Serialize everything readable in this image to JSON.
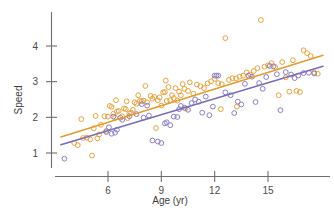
{
  "chart_data": {
    "type": "scatter",
    "title": "",
    "subtitle": "",
    "xlabel": "Age (yr)",
    "ylabel": "Speed",
    "grid": false,
    "legend": "none",
    "xlim": [
      3.3,
      18.2
    ],
    "ylim": [
      0.62,
      4.82
    ],
    "x_ticks": [
      6,
      9,
      12,
      15
    ],
    "x_tick_labels": [
      "6",
      "9",
      "12",
      "15"
    ],
    "y_ticks": [
      1,
      2,
      3,
      4
    ],
    "y_tick_labels": [
      "1",
      "2",
      "3",
      "4"
    ],
    "colors": {
      "series_orange": "#e8a33d",
      "series_purple": "#8b7fc4",
      "fit_orange": "#e59b2e",
      "fit_purple": "#7a6cb8",
      "axis": "#6e6e6e",
      "text": "#3c3c3c"
    },
    "marker": {
      "shape": "open-circle",
      "radius_px": 2.4
    },
    "series": [
      {
        "name": "series-orange",
        "color": "#e8a33d",
        "fit_line": {
          "color": "#e59b2e",
          "intercept": 0.93,
          "slope": 0.155,
          "x_start": 3.35,
          "x_end": 18.1,
          "y_start": 1.45,
          "y_end": 3.74
        },
        "points": [
          [
            4.1,
            1.28
          ],
          [
            4.3,
            1.22
          ],
          [
            4.5,
            1.95
          ],
          [
            4.6,
            1.42
          ],
          [
            4.8,
            1.43
          ],
          [
            5.0,
            1.38
          ],
          [
            5.1,
            0.93
          ],
          [
            5.2,
            1.69
          ],
          [
            5.3,
            2.04
          ],
          [
            5.4,
            1.41
          ],
          [
            5.5,
            1.52
          ],
          [
            5.6,
            1.79
          ],
          [
            5.8,
            2.03
          ],
          [
            5.9,
            1.62
          ],
          [
            6.0,
            2.02
          ],
          [
            6.1,
            2.32
          ],
          [
            6.2,
            2.29
          ],
          [
            6.3,
            2.1
          ],
          [
            6.4,
            1.99
          ],
          [
            6.5,
            2.16
          ],
          [
            6.6,
            2.18
          ],
          [
            6.8,
            2.03
          ],
          [
            6.9,
            2.25
          ],
          [
            7.0,
            2.23
          ],
          [
            7.1,
            1.98
          ],
          [
            7.2,
            2.11
          ],
          [
            7.3,
            2.13
          ],
          [
            7.4,
            2.21
          ],
          [
            7.5,
            2.42
          ],
          [
            7.6,
            2.38
          ],
          [
            7.7,
            2.62
          ],
          [
            7.8,
            2.46
          ],
          [
            7.9,
            2.45
          ],
          [
            8.0,
            2.47
          ],
          [
            8.1,
            2.88
          ],
          [
            8.2,
            2.42
          ],
          [
            8.4,
            2.6
          ],
          [
            8.5,
            2.52
          ],
          [
            8.6,
            2.57
          ],
          [
            8.7,
            1.7
          ],
          [
            8.8,
            2.48
          ],
          [
            8.9,
            2.56
          ],
          [
            9.0,
            2.33
          ],
          [
            9.1,
            2.7
          ],
          [
            9.2,
            2.71
          ],
          [
            9.3,
            2.46
          ],
          [
            9.4,
            2.85
          ],
          [
            9.5,
            2.48
          ],
          [
            9.6,
            2.62
          ],
          [
            9.7,
            2.54
          ],
          [
            9.8,
            2.82
          ],
          [
            9.9,
            2.47
          ],
          [
            10.0,
            2.72
          ],
          [
            10.1,
            2.62
          ],
          [
            10.2,
            2.93
          ],
          [
            10.3,
            2.8
          ],
          [
            10.5,
            2.74
          ],
          [
            10.6,
            2.98
          ],
          [
            10.8,
            2.66
          ],
          [
            11.0,
            2.92
          ],
          [
            11.2,
            2.87
          ],
          [
            11.4,
            2.82
          ],
          [
            11.6,
            2.95
          ],
          [
            11.8,
            3.01
          ],
          [
            12.0,
            3.08
          ],
          [
            12.2,
            2.96
          ],
          [
            12.4,
            2.93
          ],
          [
            12.6,
            4.22
          ],
          [
            12.8,
            3.05
          ],
          [
            13.0,
            3.1
          ],
          [
            13.2,
            3.09
          ],
          [
            13.4,
            3.14
          ],
          [
            13.6,
            3.17
          ],
          [
            13.8,
            3.26
          ],
          [
            14.0,
            3.2
          ],
          [
            14.2,
            3.3
          ],
          [
            14.4,
            3.38
          ],
          [
            14.6,
            4.73
          ],
          [
            14.8,
            3.42
          ],
          [
            15.0,
            3.46
          ],
          [
            15.2,
            3.52
          ],
          [
            15.4,
            3.41
          ],
          [
            15.6,
            2.62
          ],
          [
            15.8,
            3.55
          ],
          [
            16.0,
            3.12
          ],
          [
            16.2,
            2.72
          ],
          [
            16.4,
            3.6
          ],
          [
            16.6,
            2.74
          ],
          [
            16.8,
            2.71
          ],
          [
            17.0,
            3.88
          ],
          [
            17.2,
            3.8
          ],
          [
            17.4,
            3.72
          ],
          [
            17.6,
            3.26
          ],
          [
            17.8,
            3.22
          ],
          [
            6.45,
            2.48
          ],
          [
            7.05,
            2.45
          ],
          [
            9.25,
            3.03
          ],
          [
            10.35,
            2.25
          ],
          [
            12.35,
            2.23
          ],
          [
            13.25,
            2.3
          ]
        ]
      },
      {
        "name": "series-purple",
        "color": "#8b7fc4",
        "fit_line": {
          "color": "#7a6cb8",
          "intercept": 0.73,
          "slope": 0.149,
          "x_start": 3.35,
          "x_end": 18.1,
          "y_start": 1.23,
          "y_end": 3.43
        },
        "points": [
          [
            3.55,
            0.84
          ],
          [
            5.9,
            1.59
          ],
          [
            6.05,
            1.72
          ],
          [
            6.2,
            1.54
          ],
          [
            6.4,
            1.57
          ],
          [
            6.5,
            1.65
          ],
          [
            6.7,
            1.99
          ],
          [
            6.8,
            1.93
          ],
          [
            7.2,
            2.03
          ],
          [
            7.6,
            2.09
          ],
          [
            8.0,
            1.99
          ],
          [
            8.3,
            2.05
          ],
          [
            8.5,
            1.35
          ],
          [
            8.8,
            1.32
          ],
          [
            9.0,
            1.28
          ],
          [
            9.2,
            1.83
          ],
          [
            9.3,
            1.86
          ],
          [
            9.5,
            1.78
          ],
          [
            9.7,
            2.02
          ],
          [
            9.9,
            2.01
          ],
          [
            10.1,
            2.32
          ],
          [
            10.3,
            2.27
          ],
          [
            10.5,
            2.21
          ],
          [
            10.7,
            2.4
          ],
          [
            10.9,
            2.5
          ],
          [
            11.1,
            2.44
          ],
          [
            11.3,
            2.13
          ],
          [
            11.5,
            2.58
          ],
          [
            11.7,
            2.06
          ],
          [
            12.0,
            3.17
          ],
          [
            12.1,
            3.17
          ],
          [
            12.2,
            3.17
          ],
          [
            12.6,
            2.7
          ],
          [
            12.9,
            2.62
          ],
          [
            13.1,
            2.12
          ],
          [
            13.3,
            2.44
          ],
          [
            13.5,
            2.36
          ],
          [
            13.7,
            2.94
          ],
          [
            13.9,
            3.17
          ],
          [
            14.1,
            3.14
          ],
          [
            14.3,
            2.43
          ],
          [
            14.5,
            2.96
          ],
          [
            14.7,
            2.8
          ],
          [
            14.9,
            3.13
          ],
          [
            15.1,
            3.44
          ],
          [
            15.3,
            3.43
          ],
          [
            15.5,
            3.21
          ],
          [
            15.7,
            2.2
          ],
          [
            16.0,
            3.27
          ],
          [
            16.3,
            3.2
          ],
          [
            16.5,
            3.1
          ],
          [
            16.7,
            3.17
          ],
          [
            17.0,
            3.24
          ],
          [
            17.3,
            3.25
          ],
          [
            17.6,
            3.23
          ],
          [
            6.3,
            2.02
          ],
          [
            7.9,
            2.37
          ],
          [
            8.2,
            2.33
          ],
          [
            10.0,
            2.23
          ],
          [
            11.9,
            2.3
          ]
        ]
      }
    ]
  },
  "accessibility": {
    "description": "Scatter plot of Speed versus Age (yr) with two overlapping point groups in orange and purple, each with a straight fitted regression line of positive slope."
  }
}
